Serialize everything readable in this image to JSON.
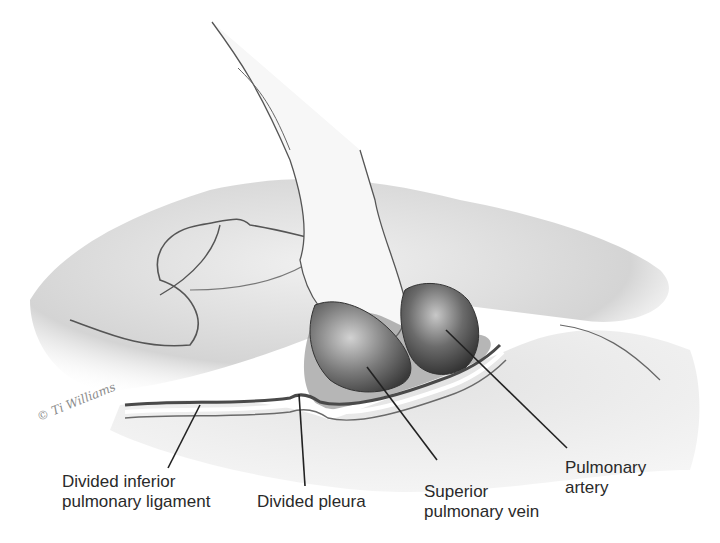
{
  "figure": {
    "signature": "© Ti Williams",
    "labels": [
      {
        "id": "divided-inferior-pulmonary-ligament",
        "lines": [
          "Divided inferior",
          "pulmonary ligament"
        ]
      },
      {
        "id": "divided-pleura",
        "lines": [
          "Divided pleura"
        ]
      },
      {
        "id": "superior-pulmonary-vein",
        "lines": [
          "Superior",
          "pulmonary vein"
        ]
      },
      {
        "id": "pulmonary-artery",
        "lines": [
          "Pulmonary",
          "artery"
        ]
      }
    ]
  },
  "colors": {
    "background": "#ffffff",
    "line": "#222222",
    "shade_light": "#e6e6e6",
    "shade_mid": "#bdbdbd",
    "shade_dark": "#5a5a5a"
  }
}
